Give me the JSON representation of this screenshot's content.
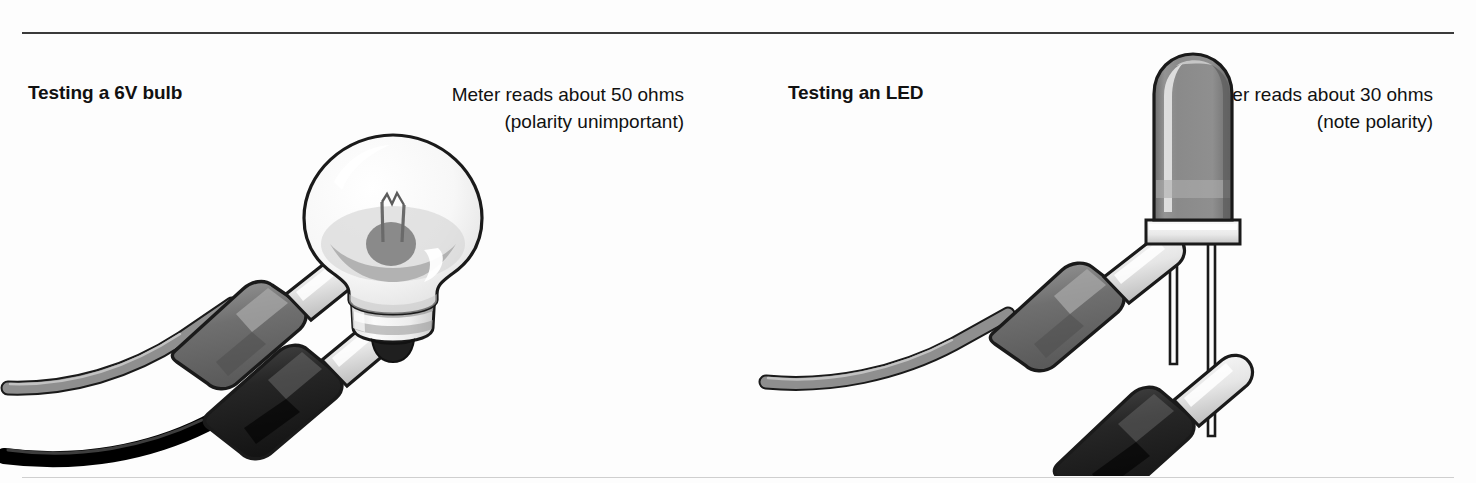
{
  "figure": {
    "background_color": "#fdfdfd",
    "rule_color": "#3a3a3a",
    "panels": [
      {
        "id": "bulb",
        "heading": "Testing a 6V bulb",
        "caption_line1": "Meter reads about 50 ohms",
        "caption_line2": "(polarity unimportant)",
        "illustration": {
          "name": "multimeter-probes-on-6v-bulb",
          "parts": [
            "glass-bulb-envelope",
            "filament",
            "screw-base",
            "grey-test-probe",
            "black-test-probe"
          ]
        }
      },
      {
        "id": "led",
        "heading": "Testing an LED",
        "caption_line1": "Meter reads about 30 ohms",
        "caption_line2": "(note polarity)",
        "illustration": {
          "name": "multimeter-probes-on-led",
          "parts": [
            "led-dome-body",
            "led-flange",
            "led-anode-leg",
            "led-cathode-leg",
            "grey-test-probe",
            "black-test-probe"
          ]
        }
      }
    ]
  },
  "colors": {
    "outline": "#1a1a1a",
    "glass_light": "#f4f4f4",
    "glass_shadow": "#b8b8b8",
    "metal_light": "#ececec",
    "metal_mid": "#9a9a9a",
    "probe_grey": "#7d7d7d",
    "probe_grey_dark": "#5e5e5e",
    "probe_black": "#262626",
    "probe_black_mid": "#444444",
    "lead_grey": "#8a8a8a",
    "lead_black": "#111111",
    "led_body": "#8d8d8d",
    "led_body_dark": "#6f6f6f",
    "led_highlight": "#d8d8d8"
  }
}
